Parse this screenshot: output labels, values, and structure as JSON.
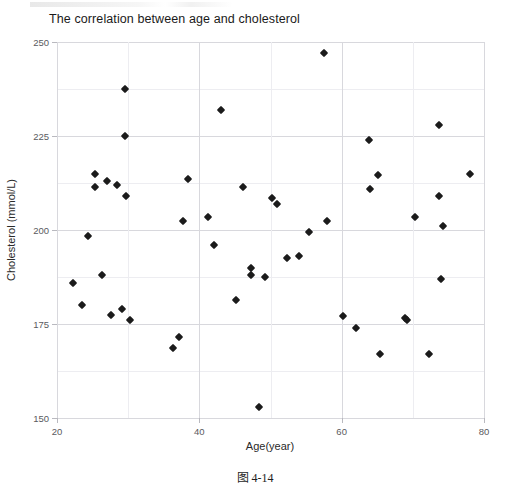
{
  "chart_data": {
    "type": "scatter",
    "title": "The correlation between age and cholesterol",
    "xlabel": "Age(year)",
    "ylabel": "Cholesterol (mmol/L)",
    "xlim": [
      20,
      80
    ],
    "ylim": [
      150,
      250
    ],
    "xticks": [
      20,
      40,
      60,
      80
    ],
    "yticks": [
      150,
      175,
      200,
      225,
      250
    ],
    "x_minor_step": 10,
    "y_minor_step": 12.5,
    "grid": true,
    "legend": null,
    "marker": "diamond",
    "marker_color": "#1b1b1b",
    "caption": "图 4-14",
    "points": [
      {
        "x": 22.2,
        "y": 186.0
      },
      {
        "x": 23.5,
        "y": 180.0
      },
      {
        "x": 24.3,
        "y": 198.5
      },
      {
        "x": 25.4,
        "y": 215.0
      },
      {
        "x": 25.4,
        "y": 211.5
      },
      {
        "x": 26.3,
        "y": 188.0
      },
      {
        "x": 27.0,
        "y": 213.0
      },
      {
        "x": 27.6,
        "y": 177.5
      },
      {
        "x": 28.4,
        "y": 212.0
      },
      {
        "x": 29.1,
        "y": 179.0
      },
      {
        "x": 29.6,
        "y": 237.5
      },
      {
        "x": 29.6,
        "y": 225.0
      },
      {
        "x": 29.7,
        "y": 209.0
      },
      {
        "x": 30.2,
        "y": 176.0
      },
      {
        "x": 36.3,
        "y": 168.5
      },
      {
        "x": 37.2,
        "y": 171.5
      },
      {
        "x": 37.7,
        "y": 202.5
      },
      {
        "x": 38.4,
        "y": 213.5
      },
      {
        "x": 41.2,
        "y": 203.5
      },
      {
        "x": 42.0,
        "y": 196.0
      },
      {
        "x": 43.0,
        "y": 232.0
      },
      {
        "x": 45.2,
        "y": 181.5
      },
      {
        "x": 46.2,
        "y": 211.5
      },
      {
        "x": 47.2,
        "y": 190.0
      },
      {
        "x": 47.2,
        "y": 188.0
      },
      {
        "x": 48.4,
        "y": 153.0
      },
      {
        "x": 49.2,
        "y": 187.5
      },
      {
        "x": 50.2,
        "y": 208.5
      },
      {
        "x": 50.9,
        "y": 207.0
      },
      {
        "x": 52.3,
        "y": 192.5
      },
      {
        "x": 54.0,
        "y": 193.0
      },
      {
        "x": 55.4,
        "y": 199.5
      },
      {
        "x": 57.5,
        "y": 247.0
      },
      {
        "x": 58.0,
        "y": 202.5
      },
      {
        "x": 60.2,
        "y": 177.0
      },
      {
        "x": 62.0,
        "y": 174.0
      },
      {
        "x": 63.8,
        "y": 224.0
      },
      {
        "x": 64.0,
        "y": 211.0
      },
      {
        "x": 65.1,
        "y": 214.5
      },
      {
        "x": 65.4,
        "y": 167.0
      },
      {
        "x": 68.9,
        "y": 176.5
      },
      {
        "x": 69.2,
        "y": 176.0
      },
      {
        "x": 70.3,
        "y": 203.5
      },
      {
        "x": 72.3,
        "y": 167.0
      },
      {
        "x": 73.7,
        "y": 228.0
      },
      {
        "x": 73.7,
        "y": 209.0
      },
      {
        "x": 73.9,
        "y": 187.0
      },
      {
        "x": 74.3,
        "y": 201.0
      },
      {
        "x": 78.1,
        "y": 215.0
      }
    ]
  },
  "axis": {
    "y_tick_labels": [
      "250",
      "225",
      "200",
      "175",
      "150"
    ],
    "x_tick_labels": [
      "20",
      "40",
      "60",
      "80"
    ]
  }
}
